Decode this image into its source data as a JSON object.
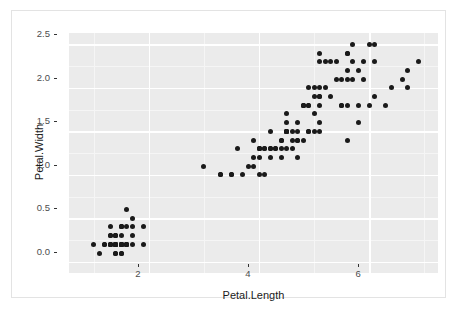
{
  "figure": {
    "background": "#ffffff",
    "frame_color": "#e3e3e3",
    "panel_background": "#ebebeb",
    "gridline_major_color": "#ffffff",
    "gridline_minor_color": "#f5f5f5",
    "point_color": "#1a1a1a"
  },
  "axes": {
    "x_title": "Petal.Length",
    "y_title": "Petal.Width",
    "x_ticks": [
      "2",
      "4",
      "6"
    ],
    "y_ticks": [
      "0.0",
      "0.5",
      "1.0",
      "1.5",
      "2.0",
      "2.5"
    ]
  },
  "chart_data": {
    "type": "scatter",
    "title": "",
    "xlabel": "Petal.Length",
    "ylabel": "Petal.Width",
    "xlim": [
      0.55,
      7.25
    ],
    "ylim": [
      -0.13,
      2.63
    ],
    "xticks": [
      2,
      4,
      6
    ],
    "yticks": [
      0.0,
      0.5,
      1.0,
      1.5,
      2.0,
      2.5
    ],
    "x_minor_ticks": [
      1,
      3,
      5,
      7
    ],
    "y_minor_ticks": [
      0.25,
      0.75,
      1.25,
      1.75,
      2.25
    ],
    "grid": true,
    "legend": "none",
    "marker": {
      "shape": "circle",
      "size": 5,
      "color": "#1a1a1a"
    },
    "n_points": 150,
    "x": [
      1.4,
      1.4,
      1.3,
      1.5,
      1.4,
      1.7,
      1.4,
      1.5,
      1.4,
      1.5,
      1.5,
      1.6,
      1.4,
      1.1,
      1.2,
      1.5,
      1.3,
      1.4,
      1.7,
      1.5,
      1.7,
      1.5,
      1.0,
      1.7,
      1.9,
      1.6,
      1.6,
      1.5,
      1.4,
      1.6,
      1.6,
      1.5,
      1.5,
      1.4,
      1.5,
      1.2,
      1.3,
      1.4,
      1.3,
      1.5,
      1.3,
      1.3,
      1.3,
      1.6,
      1.9,
      1.4,
      1.6,
      1.4,
      1.5,
      1.4,
      4.7,
      4.5,
      4.9,
      4.0,
      4.6,
      4.5,
      4.7,
      3.3,
      4.6,
      3.9,
      3.5,
      4.2,
      4.0,
      4.7,
      3.6,
      4.4,
      4.5,
      4.1,
      4.5,
      3.9,
      4.8,
      4.0,
      4.9,
      4.7,
      4.3,
      4.4,
      4.8,
      5.0,
      4.5,
      3.5,
      3.8,
      3.7,
      3.9,
      5.1,
      4.5,
      4.5,
      4.7,
      4.4,
      4.1,
      4.0,
      4.4,
      4.6,
      4.0,
      3.3,
      4.2,
      4.2,
      4.2,
      4.3,
      3.0,
      4.1,
      6.0,
      5.1,
      5.9,
      5.6,
      5.8,
      6.6,
      4.5,
      6.3,
      5.8,
      6.1,
      5.1,
      5.3,
      5.5,
      5.0,
      5.1,
      5.3,
      5.5,
      6.7,
      6.9,
      5.0,
      5.7,
      4.9,
      6.7,
      4.9,
      5.7,
      6.0,
      4.8,
      4.9,
      5.6,
      5.8,
      6.1,
      6.4,
      5.6,
      5.1,
      5.6,
      6.1,
      5.6,
      5.5,
      4.8,
      5.4,
      5.6,
      5.1,
      5.1,
      5.9,
      5.7,
      5.2,
      5.0,
      5.2,
      5.4,
      5.1
    ],
    "y": [
      0.2,
      0.2,
      0.2,
      0.2,
      0.2,
      0.4,
      0.3,
      0.2,
      0.2,
      0.1,
      0.2,
      0.2,
      0.1,
      0.1,
      0.2,
      0.4,
      0.4,
      0.3,
      0.3,
      0.3,
      0.2,
      0.4,
      0.2,
      0.5,
      0.2,
      0.2,
      0.4,
      0.2,
      0.2,
      0.2,
      0.2,
      0.4,
      0.1,
      0.2,
      0.2,
      0.2,
      0.2,
      0.1,
      0.2,
      0.2,
      0.3,
      0.3,
      0.2,
      0.6,
      0.4,
      0.3,
      0.2,
      0.2,
      0.2,
      0.2,
      1.4,
      1.5,
      1.5,
      1.3,
      1.5,
      1.3,
      1.6,
      1.0,
      1.3,
      1.4,
      1.0,
      1.5,
      1.0,
      1.4,
      1.3,
      1.4,
      1.5,
      1.0,
      1.5,
      1.1,
      1.8,
      1.3,
      1.5,
      1.2,
      1.3,
      1.4,
      1.4,
      1.7,
      1.5,
      1.0,
      1.1,
      1.0,
      1.2,
      1.6,
      1.5,
      1.6,
      1.5,
      1.3,
      1.3,
      1.3,
      1.2,
      1.4,
      1.2,
      1.0,
      1.3,
      1.2,
      1.3,
      1.3,
      1.1,
      1.3,
      2.5,
      1.9,
      2.1,
      1.8,
      2.2,
      2.1,
      1.7,
      1.8,
      1.8,
      2.5,
      2.0,
      1.9,
      2.1,
      2.0,
      2.4,
      2.3,
      1.8,
      2.2,
      2.3,
      1.5,
      2.3,
      2.0,
      2.0,
      1.8,
      2.1,
      1.8,
      1.8,
      1.8,
      2.1,
      1.6,
      1.9,
      2.0,
      2.2,
      1.5,
      1.4,
      2.3,
      2.4,
      1.8,
      1.8,
      2.1,
      2.4,
      2.3,
      1.9,
      2.3,
      2.5,
      2.3,
      1.9,
      2.0,
      2.3,
      1.8
    ]
  }
}
